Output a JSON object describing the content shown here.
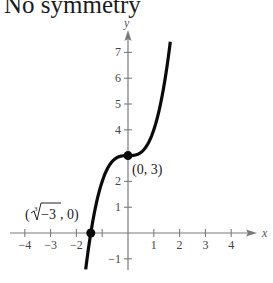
{
  "title": "No symmetry",
  "chart_data": {
    "type": "line",
    "title": "No symmetry",
    "function": "y = x^3 + 3",
    "xlabel": "x",
    "ylabel": "y",
    "xlim": [
      -4.5,
      4.8
    ],
    "ylim": [
      -1.45,
      7.7
    ],
    "x_ticks": [
      -4,
      -3,
      -2,
      -1,
      1,
      2,
      3,
      4
    ],
    "x_tick_labels": [
      "−4",
      "−3",
      "−2",
      "",
      "1",
      "2",
      "3",
      "4"
    ],
    "y_ticks": [
      -1,
      1,
      2,
      3,
      4,
      5,
      6,
      7
    ],
    "y_tick_labels": [
      "−1",
      "1",
      "2",
      "",
      "4",
      "5",
      "6",
      "7"
    ],
    "grid": false,
    "series": [
      {
        "name": "y = x^3 + 3",
        "x": [
          -1.64,
          -1.5,
          -1.442,
          -1.25,
          -1.0,
          -0.75,
          -0.5,
          -0.25,
          0,
          0.25,
          0.5,
          0.75,
          1.0,
          1.25,
          1.5,
          1.65
        ],
        "y": [
          -1.41,
          -0.375,
          0,
          1.05,
          2.0,
          2.58,
          2.875,
          2.98,
          3,
          3.02,
          3.125,
          3.42,
          4.0,
          4.95,
          6.375,
          7.49
        ]
      }
    ],
    "annotations": [
      {
        "label": "(0, 3)",
        "x": 0,
        "y": 3
      },
      {
        "label": "(∛−3, 0)",
        "x": -1.442,
        "y": 0
      }
    ]
  },
  "labels": {
    "point1": "(0, 3)",
    "point2_open": "(",
    "point2_index": "3",
    "point2_radicand": "−3",
    "point2_close": ", 0)",
    "x_axis": "x",
    "y_axis": "y"
  },
  "colors": {
    "curve": "#0a0a0a",
    "axis": "#7a7a7a"
  }
}
